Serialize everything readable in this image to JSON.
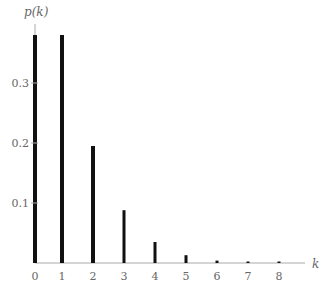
{
  "chart_data": {
    "type": "bar",
    "title": "",
    "xlabel": "k",
    "ylabel": "p(k)",
    "categories": [
      "0",
      "1",
      "2",
      "3",
      "4",
      "5",
      "6",
      "7",
      "8"
    ],
    "values": [
      0.38,
      0.38,
      0.195,
      0.088,
      0.035,
      0.013,
      0.004,
      0.002,
      0.002
    ],
    "ylim": [
      0,
      0.38
    ],
    "yticks": [
      "0.1",
      "0.2",
      "0.3"
    ],
    "ytick_values": [
      0.1,
      0.2,
      0.3
    ],
    "grid": false,
    "legend": null,
    "bar_color": "#111111",
    "axis_color": "#aaaaaa"
  },
  "labels": {
    "ylabel": "p(k)",
    "xlabel": "k"
  }
}
